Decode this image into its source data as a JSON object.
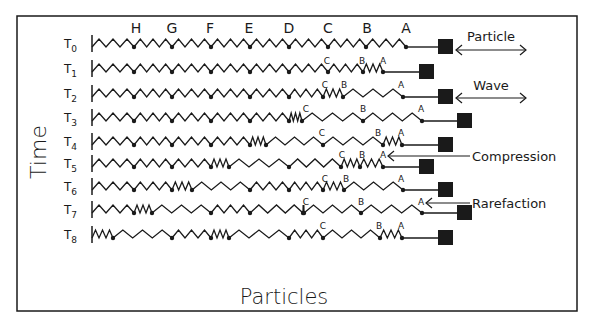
{
  "figure": {
    "frame": {
      "x": 17,
      "y": 16,
      "w": 560,
      "h": 295
    },
    "y_axis_label": "Time",
    "x_axis_label": "Particles",
    "particle_labels": [
      "H",
      "G",
      "F",
      "E",
      "D",
      "C",
      "B",
      "A"
    ],
    "particle_label_x": [
      136,
      172,
      210,
      249,
      289,
      328,
      367,
      406
    ],
    "wall_x": 92,
    "stroke_color": "#1a1a1a",
    "legend": {
      "particle": {
        "label": "Particle",
        "x1": 456,
        "x2": 526,
        "y": 50
      },
      "wave": {
        "label": "Wave",
        "x1": 456,
        "x2": 526,
        "y": 98
      },
      "compression": {
        "label": "Compression"
      },
      "rarefaction": {
        "label": "Rarefaction"
      }
    },
    "rows": [
      {
        "label": "T",
        "sub": "0",
        "y": 47,
        "nodes": [
          134,
          172,
          211,
          250,
          289,
          328,
          366,
          406
        ],
        "block_x": 438,
        "labels": []
      },
      {
        "label": "T",
        "sub": "1",
        "y": 72,
        "nodes": [
          134,
          172,
          211,
          250,
          289,
          328,
          363,
          383
        ],
        "block_x": 419,
        "labels": [
          {
            "t": "C",
            "x": 327,
            "y": 64
          },
          {
            "t": "B",
            "x": 362,
            "y": 64
          },
          {
            "t": "A",
            "x": 383,
            "y": 64
          }
        ]
      },
      {
        "label": "T",
        "sub": "2",
        "y": 97,
        "nodes": [
          134,
          172,
          211,
          250,
          289,
          323,
          343,
          403
        ],
        "block_x": 438,
        "labels": [
          {
            "t": "C",
            "x": 325,
            "y": 88
          },
          {
            "t": "B",
            "x": 344,
            "y": 88
          },
          {
            "t": "A",
            "x": 401,
            "y": 88
          }
        ]
      },
      {
        "label": "T",
        "sub": "3",
        "y": 121,
        "nodes": [
          134,
          172,
          211,
          250,
          289,
          302,
          363,
          422
        ],
        "block_x": 457,
        "labels": [
          {
            "t": "C",
            "x": 306,
            "y": 112
          },
          {
            "t": "B",
            "x": 363,
            "y": 112
          },
          {
            "t": "A",
            "x": 421,
            "y": 112
          }
        ]
      },
      {
        "label": "T",
        "sub": "4",
        "y": 145,
        "nodes": [
          134,
          172,
          211,
          250,
          266,
          323,
          383,
          402
        ],
        "block_x": 438,
        "labels": [
          {
            "t": "C",
            "x": 322,
            "y": 136
          },
          {
            "t": "B",
            "x": 378,
            "y": 136
          },
          {
            "t": "A",
            "x": 401,
            "y": 136
          }
        ]
      },
      {
        "label": "T",
        "sub": "5",
        "y": 167,
        "nodes": [
          134,
          172,
          211,
          229,
          289,
          341,
          360,
          383
        ],
        "block_x": 419,
        "labels": [
          {
            "t": "C",
            "x": 342,
            "y": 158
          },
          {
            "t": "B",
            "x": 362,
            "y": 158
          },
          {
            "t": "A",
            "x": 383,
            "y": 158
          }
        ]
      },
      {
        "label": "T",
        "sub": "6",
        "y": 190,
        "nodes": [
          134,
          172,
          192,
          250,
          289,
          323,
          344,
          403
        ],
        "block_x": 438,
        "labels": [
          {
            "t": "C",
            "x": 325,
            "y": 182
          },
          {
            "t": "B",
            "x": 346,
            "y": 182
          },
          {
            "t": "A",
            "x": 401,
            "y": 182
          }
        ]
      },
      {
        "label": "T",
        "sub": "7",
        "y": 213,
        "nodes": [
          134,
          152,
          211,
          250,
          303,
          304,
          361,
          422
        ],
        "block_x": 457,
        "labels": [
          {
            "t": "C",
            "x": 306,
            "y": 205
          },
          {
            "t": "B",
            "x": 361,
            "y": 205
          },
          {
            "t": "A",
            "x": 421,
            "y": 205
          }
        ]
      },
      {
        "label": "T",
        "sub": "8",
        "y": 238,
        "nodes": [
          113,
          172,
          211,
          229,
          289,
          323,
          380,
          402
        ],
        "block_x": 438,
        "labels": [
          {
            "t": "C",
            "x": 323,
            "y": 229
          },
          {
            "t": "B",
            "x": 379,
            "y": 229
          },
          {
            "t": "A",
            "x": 401,
            "y": 229
          }
        ]
      }
    ]
  }
}
